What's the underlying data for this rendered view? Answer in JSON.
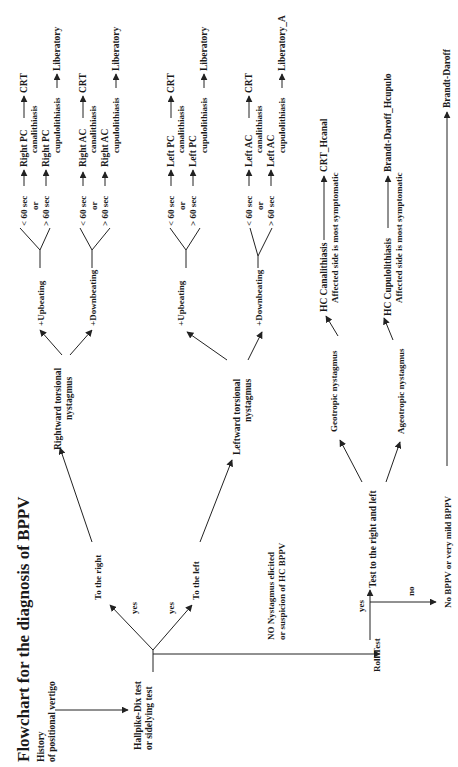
{
  "diagram": {
    "title": "Flowchart for the diagnosis of BPPV",
    "orientation": "rotated 90° counter-clockwise",
    "nodes": {
      "history_1": "History",
      "history_2": "of positional vertigo",
      "hallpike_1": "Hallpike-Dix test",
      "hallpike_2": "or sidelying test",
      "yes_right": "yes",
      "yes_left": "yes",
      "to_right": "To the right",
      "to_left": "To the left",
      "no_nyst_1": "NO Nystagmus elicited",
      "no_nyst_2": "or suspicion of HC BPPV",
      "roll_test": "Roll Test",
      "roll_yes": "yes",
      "roll_no": "no",
      "test_rl": "Test to the right  and left",
      "no_bppv": "No BPPV or very mild BPPV",
      "right_tors_1": "Rightward torsional",
      "right_tors_2": "nystagmus",
      "left_tors_1": "Leftward torsional",
      "left_tors_2": "nystagmus",
      "r_up": "+Upbeating",
      "r_down": "+Downbeating",
      "l_up": "+Upbeating",
      "l_down": "+Downbeating",
      "lt60": "< 60 sec",
      "or": "or",
      "gt60": "> 60 sec",
      "rpc_can_1": "Right PC",
      "rpc_can_2": "canalithiasis",
      "rpc_cup_1": "Right PC",
      "rpc_cup_2": "cupulolithiasis",
      "rac_can_1": "Right AC",
      "rac_can_2": "canalithiasis",
      "rac_cup_1": "Right AC",
      "rac_cup_2": "cupulolithiasis",
      "lpc_can_1": "Left PC",
      "lpc_can_2": "canalithiasis",
      "lpc_cup_1": "Left PC",
      "lpc_cup_2": "cupulolithiasis",
      "lac_can_1": "Left AC",
      "lac_can_2": "canalithiasis",
      "lac_cup_1": "Left AC",
      "lac_cup_2": "cupulolithiasis",
      "geo": "Geotropic nystagmus",
      "ageo": "Ageotropic nystagmus",
      "hc_can_1": "HC Canalithiasis",
      "hc_can_2": "Affected side  is most symptomatic",
      "hc_cup_1": "HC Cupulolithiasis",
      "hc_cup_2": "Affected side  is most symptomatic"
    },
    "treatments": {
      "crt": "CRT",
      "liberatory": "Liberatory",
      "liberatory_a": "Liberatory_A",
      "crt_hcanal": "CRT_Hcanal",
      "bd_hcupulo": "Brandt-Daroff_Hcupulo",
      "bd": "Brandt-Daroff"
    }
  }
}
